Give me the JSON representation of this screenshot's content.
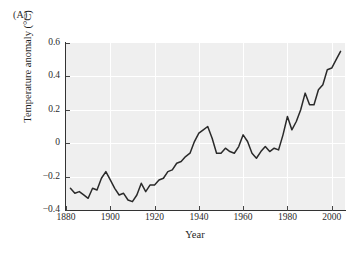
{
  "figure": {
    "panel_label": "(A)"
  },
  "chart_data": {
    "type": "line",
    "title": "",
    "xlabel": "Year",
    "ylabel": "Temperature anomaly (°C)",
    "xlim": [
      1880,
      2006
    ],
    "ylim": [
      -0.4,
      0.6
    ],
    "grid": true,
    "legend": null,
    "line_color": "#2a2a2a",
    "panel_background": "#efefef",
    "gridline_color": "#ffffff",
    "xticks": [
      1880,
      1900,
      1920,
      1940,
      1960,
      1980,
      2000
    ],
    "xtick_labels": [
      "1880",
      "1900",
      "1920",
      "1940",
      "1960",
      "1980",
      "2000"
    ],
    "yticks": [
      -0.4,
      -0.2,
      0,
      0.2,
      0.4,
      0.6
    ],
    "ytick_labels": [
      "−0.4",
      "−0.2",
      "0",
      "0.2",
      "0.4",
      "0.6"
    ],
    "series": [
      {
        "name": "Global temperature anomaly",
        "x": [
          1882,
          1884,
          1886,
          1888,
          1890,
          1892,
          1894,
          1896,
          1898,
          1900,
          1902,
          1904,
          1906,
          1908,
          1910,
          1912,
          1914,
          1916,
          1918,
          1920,
          1922,
          1924,
          1926,
          1928,
          1930,
          1932,
          1934,
          1936,
          1938,
          1940,
          1942,
          1944,
          1946,
          1948,
          1950,
          1952,
          1954,
          1956,
          1958,
          1960,
          1962,
          1964,
          1966,
          1968,
          1970,
          1972,
          1974,
          1976,
          1978,
          1980,
          1982,
          1984,
          1986,
          1988,
          1990,
          1992,
          1994,
          1996,
          1998,
          2000,
          2002,
          2004
        ],
        "y": [
          -0.27,
          -0.3,
          -0.29,
          -0.31,
          -0.33,
          -0.27,
          -0.28,
          -0.21,
          -0.17,
          -0.22,
          -0.27,
          -0.31,
          -0.3,
          -0.34,
          -0.35,
          -0.31,
          -0.24,
          -0.29,
          -0.25,
          -0.25,
          -0.22,
          -0.21,
          -0.17,
          -0.16,
          -0.12,
          -0.11,
          -0.08,
          -0.06,
          0.01,
          0.06,
          0.08,
          0.1,
          0.03,
          -0.06,
          -0.06,
          -0.03,
          -0.05,
          -0.06,
          -0.02,
          0.05,
          0.01,
          -0.06,
          -0.09,
          -0.05,
          -0.02,
          -0.05,
          -0.03,
          -0.04,
          0.05,
          0.16,
          0.08,
          0.13,
          0.2,
          0.3,
          0.23,
          0.23,
          0.32,
          0.35,
          0.44,
          0.45,
          0.5,
          0.55
        ]
      }
    ]
  }
}
